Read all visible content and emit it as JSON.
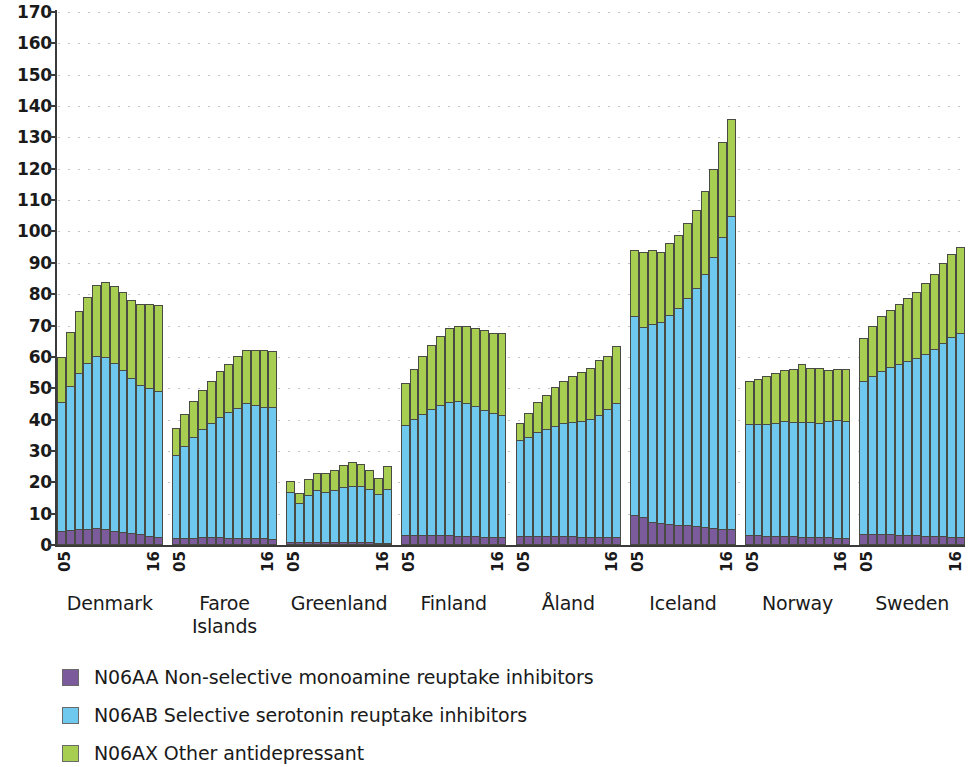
{
  "chart_data": {
    "type": "bar",
    "subtype": "stacked-bar-grouped",
    "title": "",
    "xlabel": "",
    "ylabel": "",
    "ylim": [
      0,
      170
    ],
    "ytick_step": 10,
    "yticks": [
      170,
      160,
      150,
      140,
      130,
      120,
      110,
      100,
      90,
      80,
      70,
      60,
      50,
      40,
      30,
      20,
      10,
      0
    ],
    "grid": true,
    "grid_style": "dotted-horizontal",
    "legend_position": "below",
    "series": [
      {
        "name": "N06AA Non-selective monoamine reuptake inhibitors",
        "key": "aa",
        "color": "#7c5b9c"
      },
      {
        "name": "N06AB Selective serotonin reuptake inhibitors",
        "key": "ab",
        "color": "#6fc9ee"
      },
      {
        "name": "N06AX Other antidepressant",
        "key": "ax",
        "color": "#a7ce51"
      }
    ],
    "x_tick_first": "05",
    "x_tick_last": "16",
    "years": [
      "05",
      "06",
      "07",
      "08",
      "09",
      "10",
      "11",
      "12",
      "13",
      "14",
      "15",
      "16"
    ],
    "groups": [
      {
        "country": "Denmark",
        "aa": [
          4.5,
          4.8,
          5.0,
          5.2,
          5.3,
          5.0,
          4.6,
          4.2,
          3.8,
          3.4,
          3.0,
          2.7
        ],
        "ab": [
          41.0,
          46.0,
          50.0,
          53.0,
          55.0,
          55.0,
          53.5,
          51.5,
          49.5,
          47.5,
          47.0,
          46.5
        ],
        "ax": [
          14.5,
          17.0,
          19.5,
          21.0,
          22.5,
          24.0,
          24.5,
          25.0,
          25.0,
          26.0,
          27.0,
          27.3
        ],
        "totals": [
          60,
          68,
          74.5,
          79.4,
          82.8,
          84,
          82.6,
          80.7,
          78.3,
          76.9,
          77,
          76.5
        ]
      },
      {
        "country": "Faroe\nIslands",
        "aa": [
          2.2,
          2.2,
          2.3,
          2.4,
          2.4,
          2.4,
          2.3,
          2.3,
          2.2,
          2.2,
          2.1,
          2.0
        ],
        "ab": [
          26.5,
          29.5,
          32.0,
          34.5,
          36.5,
          38.5,
          40.0,
          41.5,
          43.0,
          42.5,
          42.0,
          42.0
        ],
        "ax": [
          8.5,
          10.0,
          11.5,
          12.5,
          13.5,
          14.5,
          15.5,
          16.5,
          17.0,
          17.5,
          18.0,
          18.0
        ],
        "totals": [
          37.2,
          41.7,
          45.8,
          49.4,
          52.4,
          55.4,
          57.8,
          60.3,
          62.2,
          62.2,
          62.1,
          62
        ]
      },
      {
        "country": "Greenland",
        "aa": [
          1.0,
          1.0,
          1.0,
          1.0,
          1.0,
          1.0,
          1.0,
          0.9,
          0.9,
          0.9,
          0.8,
          0.8
        ],
        "ab": [
          16.0,
          12.5,
          15.0,
          16.5,
          16.0,
          16.5,
          17.5,
          18.0,
          18.0,
          17.0,
          15.5,
          17.0
        ],
        "ax": [
          3.5,
          3.0,
          5.0,
          5.5,
          6.0,
          6.5,
          7.0,
          7.5,
          7.0,
          6.0,
          5.0,
          7.5
        ],
        "totals": [
          20.5,
          16.5,
          21,
          23,
          23,
          24,
          25.5,
          26.4,
          25.9,
          23.9,
          21.3,
          25.3
        ]
      },
      {
        "country": "Finland",
        "aa": [
          3.3,
          3.3,
          3.3,
          3.3,
          3.2,
          3.1,
          3.0,
          2.9,
          2.8,
          2.7,
          2.6,
          2.5
        ],
        "ab": [
          35.0,
          37.0,
          38.5,
          40.0,
          41.5,
          42.5,
          43.0,
          42.5,
          41.5,
          40.5,
          39.5,
          39.0
        ],
        "ax": [
          13.5,
          16.0,
          18.5,
          20.5,
          22.0,
          23.5,
          24.0,
          24.5,
          25.0,
          25.5,
          25.5,
          26.0
        ],
        "totals": [
          51.8,
          56.3,
          60.3,
          63.8,
          66.7,
          69.1,
          70,
          69.9,
          69.3,
          68.7,
          67.6,
          67.5
        ]
      },
      {
        "country": "Åland",
        "aa": [
          3.0,
          3.0,
          3.0,
          3.0,
          2.9,
          2.9,
          2.8,
          2.7,
          2.6,
          2.5,
          2.4,
          2.4
        ],
        "ab": [
          30.5,
          31.5,
          33.0,
          34.0,
          35.0,
          36.0,
          36.5,
          37.0,
          37.5,
          39.0,
          41.0,
          43.0
        ],
        "ax": [
          5.5,
          7.5,
          9.5,
          11.0,
          12.5,
          13.5,
          14.5,
          15.5,
          16.5,
          17.5,
          17.0,
          18.0
        ],
        "totals": [
          39,
          42,
          45.5,
          48,
          50.4,
          52.4,
          53.8,
          55.2,
          56.6,
          59,
          60.4,
          63.4
        ]
      },
      {
        "country": "Iceland",
        "aa": [
          9.5,
          9.0,
          7.5,
          7.0,
          6.8,
          6.5,
          6.3,
          6.0,
          5.8,
          5.5,
          5.2,
          5.0
        ],
        "ab": [
          63.5,
          60.5,
          63.0,
          64.0,
          66.5,
          69.0,
          72.5,
          76.0,
          80.5,
          86.5,
          93.0,
          100.0
        ],
        "ax": [
          21.0,
          24.0,
          23.5,
          22.5,
          23.0,
          23.5,
          24.0,
          25.0,
          26.5,
          28.0,
          30.5,
          31.0
        ],
        "totals": [
          94,
          93.5,
          94,
          93.5,
          96.3,
          99,
          102.8,
          107,
          112.8,
          120,
          128.7,
          136
        ]
      },
      {
        "country": "Norway",
        "aa": [
          3.2,
          3.1,
          3.0,
          3.0,
          2.9,
          2.8,
          2.7,
          2.6,
          2.5,
          2.4,
          2.3,
          2.2
        ],
        "ab": [
          35.5,
          35.5,
          35.5,
          36.0,
          36.5,
          36.5,
          36.5,
          36.5,
          36.5,
          37.0,
          37.5,
          37.5
        ],
        "ax": [
          13.5,
          14.5,
          15.5,
          16.0,
          16.5,
          17.0,
          18.5,
          17.5,
          17.5,
          16.5,
          16.5,
          16.5
        ],
        "totals": [
          52.2,
          53.1,
          54,
          55,
          55.9,
          56.3,
          57.7,
          56.6,
          56.5,
          55.9,
          56.3,
          56.2
        ]
      },
      {
        "country": "Sweden",
        "aa": [
          3.4,
          3.4,
          3.4,
          3.4,
          3.3,
          3.2,
          3.1,
          3.0,
          2.9,
          2.8,
          2.7,
          2.6
        ],
        "ab": [
          49.0,
          50.5,
          52.0,
          53.5,
          54.5,
          55.5,
          56.5,
          58.0,
          59.5,
          61.5,
          63.5,
          65.0
        ],
        "ax": [
          13.5,
          16.0,
          17.5,
          18.0,
          19.0,
          20.0,
          21.0,
          22.5,
          24.0,
          25.5,
          26.5,
          27.5
        ],
        "totals": [
          65.9,
          69.9,
          72.9,
          74.9,
          76.8,
          78.7,
          80.6,
          83.5,
          86.4,
          89.8,
          92.7,
          95.1
        ]
      }
    ]
  }
}
